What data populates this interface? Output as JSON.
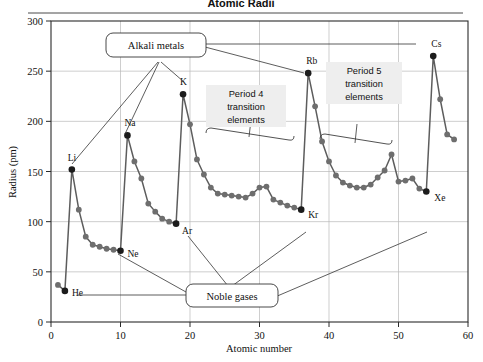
{
  "title": "Atomic Radii",
  "chart_data": {
    "type": "line",
    "title": "Atomic Radii",
    "xlabel": "Atomic number",
    "ylabel": "Radius (pm)",
    "xlim": [
      0,
      60
    ],
    "ylim": [
      0,
      300
    ],
    "xticks": [
      0,
      10,
      20,
      30,
      40,
      50,
      60
    ],
    "yticks": [
      0,
      50,
      100,
      150,
      200,
      250,
      300
    ],
    "grid": true,
    "legend": "none",
    "x": [
      1,
      2,
      3,
      4,
      5,
      6,
      7,
      8,
      9,
      10,
      11,
      12,
      13,
      14,
      15,
      16,
      17,
      18,
      19,
      20,
      21,
      22,
      23,
      24,
      25,
      26,
      27,
      28,
      29,
      30,
      31,
      32,
      33,
      34,
      35,
      36,
      37,
      38,
      39,
      40,
      41,
      42,
      43,
      44,
      45,
      46,
      47,
      48,
      49,
      50,
      51,
      52,
      53,
      54,
      55,
      56,
      57,
      58
    ],
    "values": [
      37,
      31,
      152,
      112,
      85,
      77,
      75,
      73,
      72,
      71,
      186,
      160,
      143,
      118,
      110,
      103,
      100,
      98,
      227,
      197,
      162,
      147,
      134,
      128,
      127,
      126,
      125,
      124,
      128,
      134,
      135,
      122,
      119,
      116,
      114,
      112,
      248,
      215,
      180,
      160,
      146,
      139,
      136,
      134,
      134,
      137,
      144,
      151,
      167,
      140,
      141,
      143,
      133,
      130,
      265,
      222,
      187,
      182
    ],
    "point_labels": [
      {
        "symbol": "He",
        "x": 2,
        "y": 31
      },
      {
        "symbol": "Li",
        "x": 3,
        "y": 152
      },
      {
        "symbol": "Ne",
        "x": 10,
        "y": 71
      },
      {
        "symbol": "Na",
        "x": 11,
        "y": 186
      },
      {
        "symbol": "Ar",
        "x": 18,
        "y": 98
      },
      {
        "symbol": "K",
        "x": 19,
        "y": 227
      },
      {
        "symbol": "Kr",
        "x": 36,
        "y": 112
      },
      {
        "symbol": "Rb",
        "x": 37,
        "y": 248
      },
      {
        "symbol": "Xe",
        "x": 54,
        "y": 130
      },
      {
        "symbol": "Cs",
        "x": 55,
        "y": 265
      }
    ],
    "annotations": [
      {
        "id": "alkali-metals",
        "label": "Alkali metals",
        "style": "rounded-box",
        "targets": [
          "Li",
          "Na",
          "K",
          "Rb",
          "Cs"
        ]
      },
      {
        "id": "noble-gases",
        "label": "Noble gases",
        "style": "rounded-box",
        "targets": [
          "He",
          "Ne",
          "Ar",
          "Kr",
          "Xe"
        ]
      },
      {
        "id": "period-4-transition",
        "label": "Period 4 transition elements",
        "line1": "Period 4",
        "line2": "transition",
        "line3": "elements",
        "style": "shaded-box-with-brace"
      },
      {
        "id": "period-5-transition",
        "label": "Period 5 transition elements",
        "line1": "Period 5",
        "line2": "transition",
        "line3": "elements",
        "style": "shaded-box-with-brace"
      }
    ],
    "colors": {
      "line": "#5d5d5d",
      "marker": "#6e6e6e",
      "marker_highlight": "#1c1c1c",
      "grid": "#b9b9b9",
      "frame": "#2a2a2a",
      "period_box": "#eeeeee"
    }
  }
}
